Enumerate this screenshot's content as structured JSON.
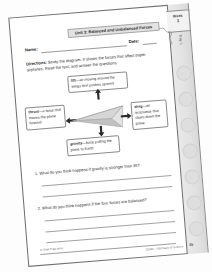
{
  "document": {
    "type": "worksheet",
    "unit_banner": "Unit 3: Balanced and Unbalanced Forces",
    "name_label": "Name:",
    "date_label": "Date:",
    "directions_bold": "Directions:",
    "directions_text": " Study the diagram. It shows the forces that affect paper airplanes. Read the text, and answer the questions.",
    "tab": {
      "week_word": "Week",
      "week_number": "1",
      "day_label": "Day 1"
    },
    "diagram": {
      "alt": "paper-airplane-forces-diagram",
      "callouts": [
        {
          "id": "lift",
          "term": "lift",
          "definition": "—air moving around the wings that pushes upward"
        },
        {
          "id": "thrust",
          "term": "thrust",
          "definition": "—a force that moves the plane forward"
        },
        {
          "id": "drag",
          "term": "drag",
          "definition": "—air resistance that slows down the plane"
        },
        {
          "id": "gravity",
          "term": "gravity",
          "definition": "—force pulling the plane to Earth"
        }
      ],
      "arrows": [
        {
          "id": "lift-arrow",
          "direction": "up"
        },
        {
          "id": "thrust-arrow",
          "direction": "left"
        },
        {
          "id": "drag-arrow",
          "direction": "right"
        },
        {
          "id": "gravity-arrow",
          "direction": "down"
        }
      ]
    },
    "questions": [
      {
        "number": "1.",
        "text": "What do you think happens if gravity is stronger than lift?",
        "answer_lines": 2
      },
      {
        "number": "2.",
        "text": "What do you think happens if the four forces are balanced?",
        "answer_lines": 3
      }
    ],
    "footer": {
      "copyright": "© Shell Education",
      "source": "51591—180 Days of Science",
      "page_number": "35"
    }
  },
  "colors": {
    "paper": "#ffffff",
    "ink": "#1f1f1f",
    "rule": "#9a9a9a",
    "banner_fill": "#e2e2e2",
    "tab_fill": "#f2f2f2",
    "strip_fill": "#e5e5e5",
    "plane_fill": "#cfcfcf"
  }
}
